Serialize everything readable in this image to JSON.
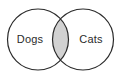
{
  "diagram": {
    "type": "venn-2-set",
    "background_color": "#ffffff",
    "stroke_color": "#2b2b2b",
    "stroke_width": 1.2,
    "circle_fill": "#ffffff",
    "intersection_fill": "#d2d2d2",
    "sets": [
      {
        "id": "left",
        "label": "Dogs",
        "center_x": 38,
        "center_y": 39.5,
        "radius": 30.5,
        "label_x": 30,
        "label_y": 40
      },
      {
        "id": "right",
        "label": "Cats",
        "center_x": 83,
        "center_y": 39.5,
        "radius": 30.5,
        "label_x": 91,
        "label_y": 40
      }
    ],
    "intersection": {
      "id": "overlap",
      "label": "",
      "shaded": true,
      "center_x": 60.5,
      "top_y": 19,
      "bottom_y": 60
    }
  }
}
